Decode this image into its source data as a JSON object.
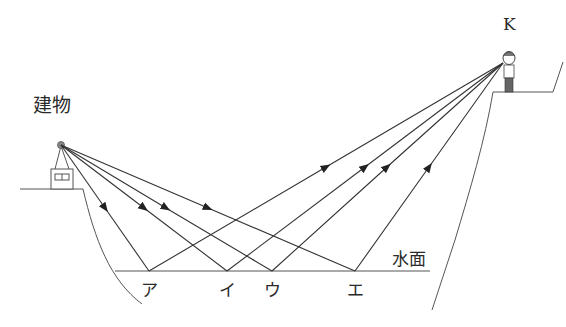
{
  "labels": {
    "building": "建物",
    "observer": "K",
    "water_surface": "水面"
  },
  "reflection_points": [
    {
      "label": "ア",
      "x": 149
    },
    {
      "label": "イ",
      "x": 227
    },
    {
      "label": "ウ",
      "x": 272
    },
    {
      "label": "エ",
      "x": 355
    }
  ],
  "colors": {
    "line": "#333333",
    "terrain": "#555555",
    "background": "#ffffff"
  }
}
